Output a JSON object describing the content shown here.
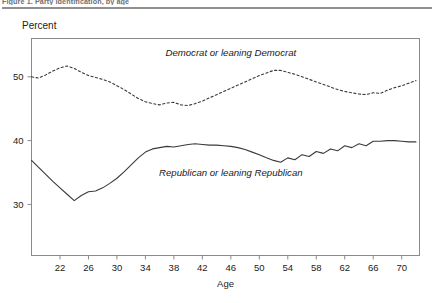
{
  "figure": {
    "caption": "Figure 1. Party identification, by age",
    "y_axis_title": "Percent"
  },
  "chart_data": {
    "type": "line",
    "title": "",
    "subtitle": "",
    "xlabel": "Age",
    "ylabel": "Percent",
    "xlim": [
      18,
      72.5
    ],
    "ylim": [
      22,
      56
    ],
    "grid": false,
    "legend_position": "inline-annotation",
    "xticks": [
      22,
      26,
      30,
      34,
      38,
      42,
      46,
      50,
      54,
      58,
      62,
      66,
      70
    ],
    "yticks": [
      30,
      40,
      50
    ],
    "x": [
      18,
      19,
      20,
      21,
      22,
      23,
      24,
      25,
      26,
      27,
      28,
      29,
      30,
      31,
      32,
      33,
      34,
      35,
      36,
      37,
      38,
      39,
      40,
      41,
      42,
      43,
      44,
      45,
      46,
      47,
      48,
      49,
      50,
      51,
      52,
      53,
      54,
      55,
      56,
      57,
      58,
      59,
      60,
      61,
      62,
      63,
      64,
      65,
      66,
      67,
      68,
      69,
      70,
      71,
      72
    ],
    "series": [
      {
        "name": "Democrat or leaning Democrat",
        "style": "dotted",
        "color": "#3a3a3a",
        "label_x": 46,
        "label_y": 53.2,
        "values": [
          50.0,
          49.8,
          50.3,
          50.9,
          51.4,
          51.7,
          51.3,
          50.7,
          50.2,
          49.9,
          49.6,
          49.2,
          48.6,
          48.0,
          47.3,
          46.6,
          46.1,
          45.8,
          45.6,
          45.9,
          46.0,
          45.6,
          45.5,
          45.8,
          46.2,
          46.7,
          47.2,
          47.7,
          48.2,
          48.7,
          49.2,
          49.7,
          50.2,
          50.6,
          51.0,
          51.0,
          50.7,
          50.4,
          50.0,
          49.6,
          49.2,
          48.8,
          48.4,
          48.0,
          47.7,
          47.5,
          47.3,
          47.2,
          47.5,
          47.4,
          47.9,
          48.3,
          48.6,
          49.0,
          49.4
        ]
      },
      {
        "name": "Republican or leaning Republican",
        "style": "solid",
        "color": "#3a3a3a",
        "label_x": 46,
        "label_y": 34.4,
        "values": [
          36.9,
          35.8,
          34.7,
          33.6,
          32.6,
          31.6,
          30.6,
          31.4,
          32.0,
          32.1,
          32.6,
          33.3,
          34.1,
          35.1,
          36.2,
          37.3,
          38.2,
          38.7,
          38.9,
          39.1,
          39.0,
          39.2,
          39.4,
          39.5,
          39.4,
          39.3,
          39.3,
          39.2,
          39.1,
          38.9,
          38.6,
          38.2,
          37.8,
          37.3,
          36.9,
          36.6,
          37.3,
          37.0,
          37.8,
          37.5,
          38.3,
          38.0,
          38.7,
          38.4,
          39.2,
          38.9,
          39.5,
          39.2,
          39.9,
          39.9,
          40.0,
          40.0,
          39.9,
          39.8,
          39.8
        ]
      }
    ]
  }
}
